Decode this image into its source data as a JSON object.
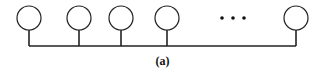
{
  "diagram": {
    "type": "bus-topology",
    "caption": "(a)",
    "nodes": [
      {
        "id": "node-1",
        "cx": 29,
        "cy": 18
      },
      {
        "id": "node-2",
        "cx": 79,
        "cy": 18
      },
      {
        "id": "node-3",
        "cx": 121,
        "cy": 18
      },
      {
        "id": "node-4",
        "cx": 167,
        "cy": 18
      },
      {
        "id": "node-n",
        "cx": 296,
        "cy": 18
      }
    ],
    "ellipsis": "• • •",
    "bus": {
      "y": 46,
      "x_start": 29,
      "x_end": 296
    },
    "node_radius": 12,
    "stroke_color": "#222222"
  }
}
